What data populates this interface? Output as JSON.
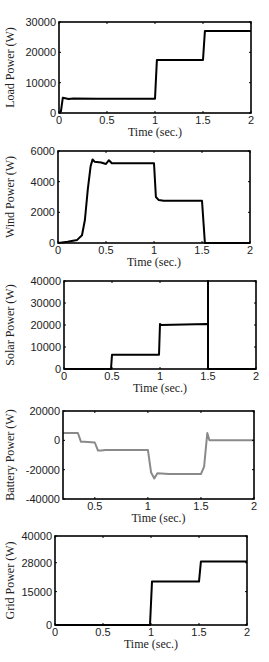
{
  "chart_data": [
    {
      "type": "line",
      "title": "",
      "xlabel": "Time (sec.)",
      "ylabel": "Load Power (W)",
      "xlim": [
        0,
        2
      ],
      "ylim": [
        0,
        30000
      ],
      "xticks": [
        "0",
        "0.5",
        "1",
        "1.5",
        "2"
      ],
      "yticks": [
        "0",
        "10000",
        "20000",
        "30000"
      ],
      "grid": false,
      "color": "#000000",
      "box": {
        "left": 59,
        "top": 22,
        "right": 251,
        "bottom": 113
      },
      "series": [
        {
          "name": "Load Power",
          "x": [
            0,
            0.02,
            0.04,
            0.1,
            0.15,
            0.4,
            0.6,
            1.0,
            1.02,
            1.5,
            1.52,
            2.0
          ],
          "y": [
            0,
            500,
            5000,
            4600,
            4800,
            4700,
            4700,
            4700,
            17500,
            17500,
            27000,
            27000
          ]
        }
      ]
    },
    {
      "type": "line",
      "title": "",
      "xlabel": "Time (sec.)",
      "ylabel": "Wind Power (W)",
      "xlim": [
        0,
        2
      ],
      "ylim": [
        0,
        6000
      ],
      "xticks": [
        "0",
        "0.5",
        "1",
        "1.5",
        "2"
      ],
      "yticks": [
        "0",
        "2000",
        "4000",
        "6000"
      ],
      "grid": false,
      "color": "#000000",
      "box": {
        "left": 58,
        "top": 151,
        "right": 250,
        "bottom": 243
      },
      "series": [
        {
          "name": "Wind Power",
          "x": [
            0,
            0.1,
            0.2,
            0.25,
            0.28,
            0.31,
            0.34,
            0.36,
            0.38,
            0.45,
            0.5,
            0.53,
            0.56,
            0.6,
            1.0,
            1.02,
            1.05,
            1.1,
            1.5,
            1.53,
            1.55,
            2.0
          ],
          "y": [
            0,
            80,
            200,
            500,
            1500,
            3500,
            5000,
            5450,
            5300,
            5250,
            5150,
            5400,
            5200,
            5200,
            5200,
            3000,
            2800,
            2750,
            2750,
            0,
            0,
            0
          ]
        }
      ]
    },
    {
      "type": "line",
      "title": "",
      "xlabel": "Time (sec.)",
      "ylabel": "Solar Power (W)",
      "xlim": [
        0,
        2
      ],
      "ylim": [
        0,
        40000
      ],
      "xticks": [
        "0",
        "0.5",
        "1",
        "1.5",
        "2"
      ],
      "yticks": [
        "0",
        "10000",
        "20000",
        "30000",
        "40000"
      ],
      "grid": false,
      "color": "#000000",
      "box": {
        "left": 64,
        "top": 281,
        "right": 256,
        "bottom": 369
      },
      "series": [
        {
          "name": "Solar Power",
          "x": [
            0,
            0.49,
            0.5,
            0.99,
            1.0,
            1.01,
            1.49,
            1.5,
            1.5,
            1.5,
            2.0
          ],
          "y": [
            0,
            0,
            6500,
            6500,
            20500,
            20000,
            20500,
            20500,
            40000,
            0,
            0
          ]
        }
      ]
    },
    {
      "type": "line",
      "title": "",
      "xlabel": "Time (sec.)",
      "ylabel": "Battery Power (W)",
      "xlim": [
        0.2,
        2
      ],
      "ylim": [
        -40000,
        20000
      ],
      "xticks": [
        "0.5",
        "1",
        "1.5",
        "2"
      ],
      "yticks": [
        "-40000",
        "-20000",
        "0",
        "20000"
      ],
      "grid": false,
      "color": "#8a8a8a",
      "box": {
        "left": 63,
        "top": 411,
        "right": 254,
        "bottom": 499
      },
      "series": [
        {
          "name": "Battery Power",
          "x": [
            0.2,
            0.34,
            0.37,
            0.4,
            0.5,
            0.53,
            0.56,
            0.6,
            1.0,
            1.03,
            1.06,
            1.09,
            1.2,
            1.5,
            1.53,
            1.56,
            1.58,
            1.62,
            2.0
          ],
          "y": [
            5000,
            5000,
            -1000,
            -1000,
            -1500,
            -7000,
            -7000,
            -6500,
            -6500,
            -22000,
            -26000,
            -22500,
            -23000,
            -23000,
            -18000,
            5000,
            0,
            0,
            0
          ]
        }
      ]
    },
    {
      "type": "line",
      "title": "",
      "xlabel": "Time (sec.)",
      "ylabel": "Grid Power (W)",
      "xlim": [
        0,
        2
      ],
      "ylim": [
        0,
        40000
      ],
      "xticks": [
        "0",
        "0.5",
        "1",
        "1.5",
        "2"
      ],
      "yticks": [
        "0",
        "15000",
        "28000",
        "40000"
      ],
      "ytick_positions": [
        0,
        15000,
        28000,
        40000
      ],
      "grid": false,
      "color": "#000000",
      "box": {
        "left": 55,
        "top": 536,
        "right": 247,
        "bottom": 625
      },
      "series": [
        {
          "name": "Grid Power",
          "x": [
            0,
            0.99,
            1.01,
            1.5,
            1.52,
            2.0
          ],
          "y": [
            0,
            0,
            19500,
            19500,
            28500,
            28500
          ]
        }
      ]
    }
  ]
}
